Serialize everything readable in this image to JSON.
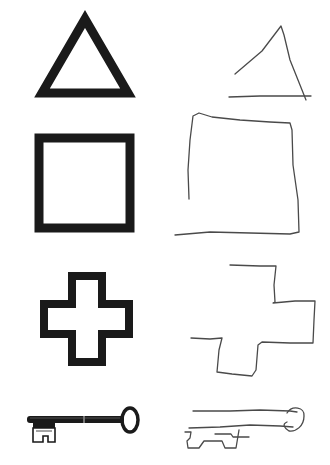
{
  "figure": {
    "colors": {
      "background": "#ffffff",
      "reference_ink": "#1a1a1a",
      "drawing_ink": "#4a4a4a"
    },
    "rows": [
      {
        "index": 1,
        "shape": "triangle",
        "reference": "outlined triangle",
        "copy": "incomplete hand-drawn triangle"
      },
      {
        "index": 2,
        "shape": "square",
        "reference": "outlined square",
        "copy": "hand-drawn open square"
      },
      {
        "index": 3,
        "shape": "cross",
        "reference": "outlined plus/cross",
        "copy": "partial hand-drawn cross"
      },
      {
        "index": 4,
        "shape": "key",
        "reference": "skeleton key illustration",
        "copy": "hand-drawn key sketch"
      }
    ]
  }
}
